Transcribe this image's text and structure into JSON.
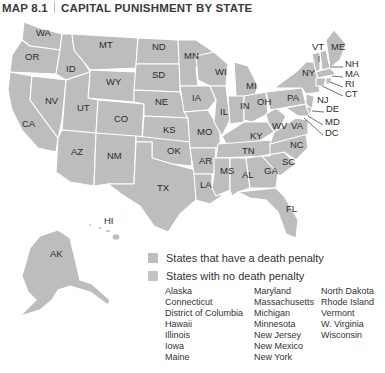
{
  "title": {
    "map_number": "MAP 8.1",
    "text": "CAPITAL PUNISHMENT BY STATE"
  },
  "colors": {
    "state_fill": "#bdbdbd",
    "border": "#ffffff",
    "swatch_death_penalty": "#bdbdbd",
    "swatch_no_death_penalty": "#c4c4c4"
  },
  "states": [
    {
      "abbr": "WA",
      "x": 36,
      "y": 33
    },
    {
      "abbr": "OR",
      "x": 25,
      "y": 57
    },
    {
      "abbr": "ID",
      "x": 66,
      "y": 69
    },
    {
      "abbr": "MT",
      "x": 99,
      "y": 45
    },
    {
      "abbr": "WY",
      "x": 106,
      "y": 82
    },
    {
      "abbr": "ND",
      "x": 152,
      "y": 47
    },
    {
      "abbr": "SD",
      "x": 152,
      "y": 75
    },
    {
      "abbr": "MN",
      "x": 184,
      "y": 56
    },
    {
      "abbr": "WI",
      "x": 215,
      "y": 72
    },
    {
      "abbr": "MI",
      "x": 246,
      "y": 86
    },
    {
      "abbr": "NV",
      "x": 45,
      "y": 101
    },
    {
      "abbr": "UT",
      "x": 77,
      "y": 108
    },
    {
      "abbr": "CO",
      "x": 114,
      "y": 119
    },
    {
      "abbr": "NE",
      "x": 155,
      "y": 102
    },
    {
      "abbr": "IA",
      "x": 192,
      "y": 98
    },
    {
      "abbr": "IL",
      "x": 220,
      "y": 112
    },
    {
      "abbr": "IN",
      "x": 240,
      "y": 106
    },
    {
      "abbr": "OH",
      "x": 257,
      "y": 102
    },
    {
      "abbr": "PA",
      "x": 287,
      "y": 98
    },
    {
      "abbr": "NY",
      "x": 302,
      "y": 73
    },
    {
      "abbr": "CA",
      "x": 22,
      "y": 124
    },
    {
      "abbr": "KS",
      "x": 163,
      "y": 130
    },
    {
      "abbr": "MO",
      "x": 197,
      "y": 132
    },
    {
      "abbr": "KY",
      "x": 250,
      "y": 136
    },
    {
      "abbr": "WV",
      "x": 272,
      "y": 126
    },
    {
      "abbr": "VA",
      "x": 291,
      "y": 126
    },
    {
      "abbr": "AZ",
      "x": 71,
      "y": 152
    },
    {
      "abbr": "NM",
      "x": 107,
      "y": 156
    },
    {
      "abbr": "OK",
      "x": 167,
      "y": 151
    },
    {
      "abbr": "AR",
      "x": 199,
      "y": 161
    },
    {
      "abbr": "TN",
      "x": 242,
      "y": 151
    },
    {
      "abbr": "NC",
      "x": 290,
      "y": 145
    },
    {
      "abbr": "SC",
      "x": 282,
      "y": 162
    },
    {
      "abbr": "MS",
      "x": 220,
      "y": 171
    },
    {
      "abbr": "AL",
      "x": 242,
      "y": 175
    },
    {
      "abbr": "GA",
      "x": 264,
      "y": 171
    },
    {
      "abbr": "LA",
      "x": 200,
      "y": 185
    },
    {
      "abbr": "TX",
      "x": 157,
      "y": 188
    },
    {
      "abbr": "FL",
      "x": 286,
      "y": 209
    },
    {
      "abbr": "AK",
      "x": 50,
      "y": 254
    },
    {
      "abbr": "HI",
      "x": 104,
      "y": 221
    }
  ],
  "callouts": [
    {
      "abbr": "VT",
      "x": 312,
      "y": 47
    },
    {
      "abbr": "ME",
      "x": 331,
      "y": 47
    },
    {
      "abbr": "NH",
      "x": 345,
      "y": 64
    },
    {
      "abbr": "MA",
      "x": 345,
      "y": 74
    },
    {
      "abbr": "RI",
      "x": 345,
      "y": 84
    },
    {
      "abbr": "CT",
      "x": 345,
      "y": 94
    },
    {
      "abbr": "NJ",
      "x": 317,
      "y": 100
    },
    {
      "abbr": "DE",
      "x": 326,
      "y": 109
    },
    {
      "abbr": "MD",
      "x": 325,
      "y": 122
    },
    {
      "abbr": "DC",
      "x": 325,
      "y": 133
    }
  ],
  "legend": {
    "death_penalty_label": "States that have a death penalty",
    "no_death_penalty_label": "States with no death penalty",
    "no_death_penalty_columns": [
      [
        "Alaska",
        "Connecticut",
        "District of Columbia",
        "Hawaii",
        "Illinois",
        "Iowa",
        "Maine"
      ],
      [
        "Maryland",
        "Massachusetts",
        "Michigan",
        "Minnesota",
        "New Jersey",
        "New Mexico",
        "New York"
      ],
      [
        "North Dakota",
        "Rhode Island",
        "Vermont",
        "W. Virginia",
        "Wisconsin"
      ]
    ]
  }
}
